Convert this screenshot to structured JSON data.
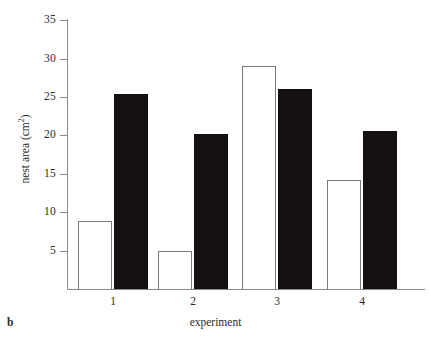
{
  "panel": {
    "label": "b"
  },
  "chart_data": {
    "type": "bar",
    "title": "",
    "subtitle": "",
    "xlabel": "experiment",
    "ylabel": "nest area (cm",
    "ylabel_sup": "2",
    "ylabel_suffix": ")",
    "categories": [
      "1",
      "2",
      "3",
      "4"
    ],
    "series": [
      {
        "name": "open",
        "color": "#ffffff",
        "edge": "#7a7a7a",
        "values": [
          8.8,
          5.0,
          29.0,
          14.2
        ]
      },
      {
        "name": "filled",
        "color": "#141010",
        "edge": "#141010",
        "values": [
          25.4,
          20.2,
          26.1,
          20.6
        ]
      }
    ],
    "ylim": [
      0,
      35
    ],
    "yticks": [
      5,
      10,
      15,
      20,
      25,
      30,
      35
    ],
    "ytick_labels": [
      "5",
      "10",
      "15",
      "20",
      "25",
      "30",
      "35"
    ],
    "grid": false,
    "legend": "none",
    "axis_color": "#8a8a8a"
  }
}
